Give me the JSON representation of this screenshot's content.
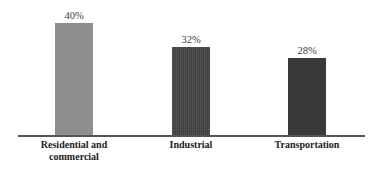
{
  "chart_data": {
    "type": "bar",
    "title": "",
    "subtitle": "",
    "xlabel": "",
    "ylabel": "",
    "categories": [
      "Residential and commercial",
      "Industrial",
      "Transportation"
    ],
    "category_lines": [
      [
        "Residential and",
        "commercial"
      ],
      [
        "Industrial"
      ],
      [
        "Transportation"
      ]
    ],
    "values": [
      40,
      32,
      28
    ],
    "value_labels": [
      "40%",
      "32%",
      "28%"
    ],
    "units": "%",
    "ylim": [
      0,
      44
    ],
    "grid": false,
    "legend": false,
    "legend_position": "none",
    "axis_line": true,
    "bar_colors": [
      "#8e8e8e",
      "#434343",
      "#3a3a3a"
    ],
    "background_color": "#ffffff",
    "axis_color": "#555555",
    "label_color": "#1b1b1b",
    "value_label_color": "#3b3b3b"
  },
  "bars": [
    {
      "name": "residential-and-commercial",
      "value_label": "40%",
      "color": "#8e8e8e",
      "left_px": 55,
      "width_px": 38,
      "height_px": 113,
      "label_left_px": 18,
      "label_width_px": 112,
      "textured": false
    },
    {
      "name": "industrial",
      "value_label": "32%",
      "color": "#434343",
      "left_px": 172,
      "width_px": 38,
      "height_px": 89,
      "label_left_px": 135,
      "label_width_px": 112,
      "textured": true
    },
    {
      "name": "transportation",
      "value_label": "28%",
      "color": "#3a3a3a",
      "left_px": 288,
      "width_px": 38,
      "height_px": 78,
      "label_left_px": 251,
      "label_width_px": 112,
      "textured": false
    }
  ]
}
